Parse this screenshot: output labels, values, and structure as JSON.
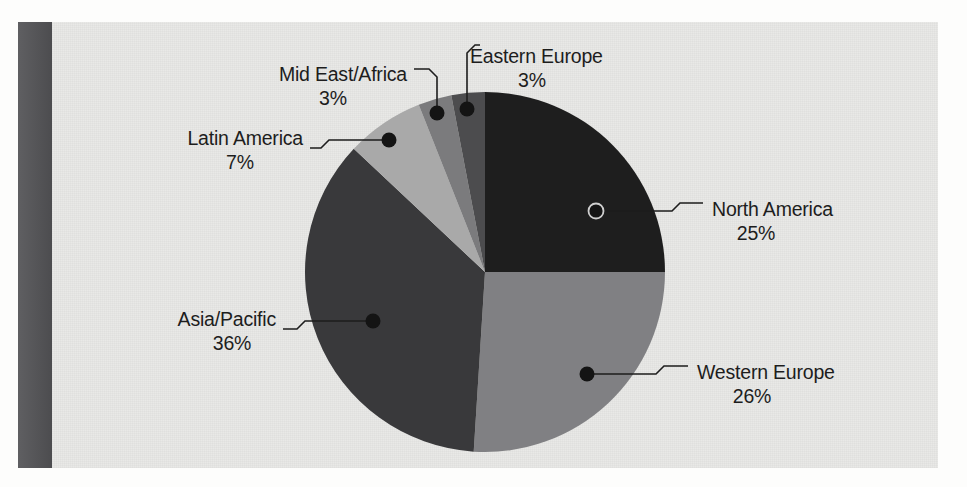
{
  "page": {
    "background_color": "#fdfdfc",
    "paper_color": "#e9e9e7",
    "spine_color": "#555558",
    "spine_name": "book-spine-bar"
  },
  "chart_data": {
    "type": "pie",
    "title": "",
    "subtitle": "",
    "xlabel": "",
    "ylabel": "",
    "grid": false,
    "legend_position": "callout-labels",
    "start_angle_deg": 0,
    "direction": "clockwise",
    "center": {
      "x": 485,
      "y": 272
    },
    "radius": 180,
    "units": "%",
    "total": 100,
    "categories": [
      "North America",
      "Western Europe",
      "Asia/Pacific",
      "Latin America",
      "Mid East/Africa",
      "Eastern Europe"
    ],
    "values": [
      25,
      26,
      36,
      7,
      3,
      3
    ],
    "colors": [
      "#1e1e1e",
      "#808083",
      "#39393b",
      "#a9a9a9",
      "#7b7b7d",
      "#4c4c4e"
    ],
    "slices": [
      {
        "label": "North America",
        "value": 25,
        "percent_text": "25%",
        "color": "#1e1e1e",
        "start_deg": 0,
        "end_deg": 90,
        "dot": {
          "x": 596,
          "y": 211,
          "style": "ring"
        },
        "leader": "M 596 211 L 672 211 L 680 203 L 703 203",
        "label_pos": {
          "x": 712,
          "y": 211
        },
        "pct_pos": {
          "x": 756,
          "y": 235
        },
        "label_anchor": "start"
      },
      {
        "label": "Western Europe",
        "value": 26,
        "percent_text": "26%",
        "color": "#808083",
        "start_deg": 90,
        "end_deg": 183.6,
        "dot": {
          "x": 587,
          "y": 374,
          "style": "solid"
        },
        "leader": "M 587 374 L 656 374 L 664 366 L 688 366",
        "label_pos": {
          "x": 697,
          "y": 374
        },
        "pct_pos": {
          "x": 752,
          "y": 398
        },
        "label_anchor": "start"
      },
      {
        "label": "Asia/Pacific",
        "value": 36,
        "percent_text": "36%",
        "color": "#39393b",
        "start_deg": 183.6,
        "end_deg": 313.2,
        "dot": {
          "x": 373,
          "y": 321,
          "style": "solid"
        },
        "leader": "M 373 321 L 305 321 L 297 329 L 283 329",
        "label_pos": {
          "x": 276,
          "y": 321
        },
        "pct_pos": {
          "x": 232,
          "y": 345
        },
        "label_anchor": "end"
      },
      {
        "label": "Latin America",
        "value": 7,
        "percent_text": "7%",
        "color": "#a9a9a9",
        "start_deg": 313.2,
        "end_deg": 338.4,
        "dot": {
          "x": 389,
          "y": 140,
          "style": "solid"
        },
        "leader": "M 389 140 L 329 140 L 321 148 L 310 148",
        "label_pos": {
          "x": 303,
          "y": 140
        },
        "pct_pos": {
          "x": 240,
          "y": 164
        },
        "label_anchor": "end"
      },
      {
        "label": "Mid East/Africa",
        "value": 3,
        "percent_text": "3%",
        "color": "#7b7b7d",
        "start_deg": 338.4,
        "end_deg": 349.2,
        "dot": {
          "x": 437,
          "y": 113,
          "style": "solid"
        },
        "leader": "M 437 113 L 437 77 L 429 69 L 414 69",
        "label_pos": {
          "x": 407,
          "y": 76
        },
        "pct_pos": {
          "x": 333,
          "y": 100
        },
        "label_anchor": "end"
      },
      {
        "label": "Eastern Europe",
        "value": 3,
        "percent_text": "3%",
        "color": "#4c4c4e",
        "start_deg": 349.2,
        "end_deg": 360,
        "dot": {
          "x": 467,
          "y": 109,
          "style": "solid"
        },
        "leader": "M 467 109 L 467 53 L 475 45 L 480 45",
        "label_pos": {
          "x": 470,
          "y": 58
        },
        "pct_pos": {
          "x": 532,
          "y": 82
        },
        "label_anchor": "start"
      }
    ]
  }
}
